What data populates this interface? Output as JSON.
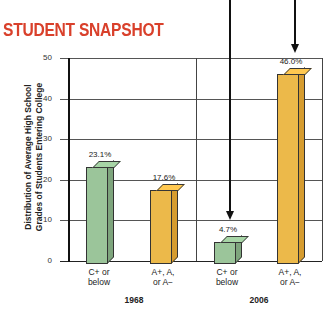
{
  "title": "STUDENT SNAPSHOT",
  "colors": {
    "title": "#d9402b",
    "green": "#9bc59a",
    "green_side": "#7ea57d",
    "orange": "#ecb94a",
    "orange_side": "#d69c2f"
  },
  "chart_data": {
    "type": "bar",
    "title": "Student Snapshot",
    "ylabel": "Distribution of Average High School Grades of Students Entering College",
    "ylabel_lines": [
      "Distribution of Average High School",
      "Grades of Students Entering College"
    ],
    "xlabel": "",
    "ylim": [
      0,
      50
    ],
    "yticks": [
      "0",
      "10",
      "20",
      "30",
      "40",
      "50"
    ],
    "grid": true,
    "groups": [
      "1968",
      "2006"
    ],
    "categories": [
      "C+ or below",
      "A+, A, or A−"
    ],
    "category_lines": [
      [
        "C+ or",
        "below"
      ],
      [
        "A+, A,",
        "or A−"
      ]
    ],
    "series": [
      {
        "name": "C+ or below",
        "values": [
          23.1,
          4.7
        ]
      },
      {
        "name": "A+, A, or A−",
        "values": [
          17.6,
          46.0
        ]
      }
    ],
    "value_labels": [
      "23.1%",
      "17.6%",
      "4.7%",
      "46.0%"
    ],
    "annotations": [
      "arrow pointing to 4.7% (2006, C+ or below)",
      "arrow pointing to 46.0% (2006, A+, A, or A−)"
    ],
    "legend": "none"
  }
}
